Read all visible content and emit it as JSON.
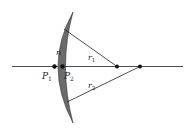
{
  "diagram": {
    "labels": {
      "n": "n",
      "r1": "r",
      "r1_sub": "1",
      "r2": "r",
      "r2_sub": "2",
      "p1": "P",
      "p1_sub": "1",
      "p2": "P",
      "p2_sub": "2"
    },
    "colors": {
      "lens_fill": "#6b6b6b",
      "line": "#222222",
      "background": "#ffffff"
    }
  }
}
